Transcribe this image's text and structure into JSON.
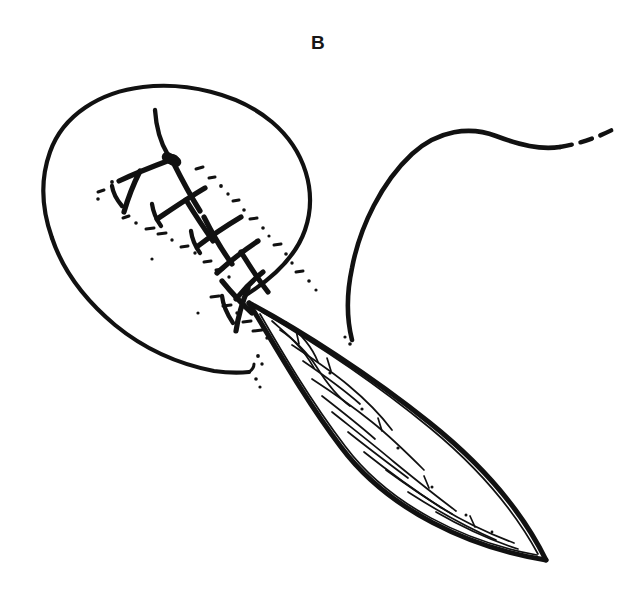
{
  "figure": {
    "panel_label": "B",
    "caption_alt": "Surgical illustration: elliptical wound closed with a running locked suture, excised spindle-shaped tissue specimen drawn below, suture thread tail trailing to the right",
    "background_color": "#ffffff",
    "ink_color": "#111111"
  },
  "elements": {
    "wound_outline_name": "wound-margin-outline",
    "suture_line_name": "running-suture-line",
    "knot_name": "suture-knot",
    "specimen_name": "excised-tissue-specimen",
    "thread_tail_name": "suture-thread-tail",
    "stipple_name": "stipple-shading"
  }
}
